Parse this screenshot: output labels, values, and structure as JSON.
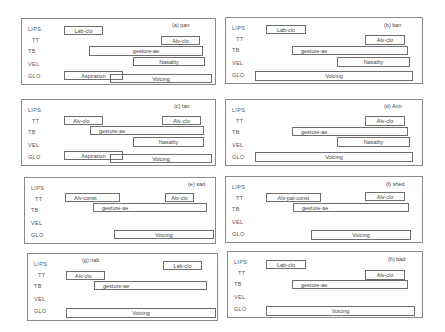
{
  "tiers": [
    {
      "key": "LIPS",
      "label": "LIPS",
      "y": 7,
      "indent": false
    },
    {
      "key": "TT",
      "label": "TT",
      "y": 18,
      "indent": true
    },
    {
      "key": "TB",
      "label": "TB",
      "y": 29,
      "indent": false
    },
    {
      "key": "VEL",
      "label": "VEL",
      "y": 42,
      "indent": false
    },
    {
      "key": "GLO",
      "label": "GLO",
      "y": 54,
      "indent": false
    }
  ],
  "panels": [
    {
      "id": "a",
      "title": "(a) pan",
      "x": 21,
      "y": 18,
      "w": 195,
      "h": 67,
      "title_x": 150,
      "title_y": 3,
      "gestures": [
        {
          "label": "Lab-clo",
          "tier": "LIPS",
          "x": 42,
          "y": 7,
          "w": 39,
          "h": 9,
          "align": "center"
        },
        {
          "label": "Alv-clo",
          "tier": "TT",
          "x": 139,
          "y": 17,
          "w": 39,
          "h": 9,
          "align": "center"
        },
        {
          "label": "gesture-ae",
          "tier": "TB",
          "x": 67,
          "y": 27,
          "w": 114,
          "h": 10,
          "align": "center"
        },
        {
          "label": "Nasality",
          "tier": "VEL",
          "x": 111,
          "y": 38,
          "w": 72,
          "h": 9,
          "align": "center"
        },
        {
          "label": "Voicing",
          "tier": "GLO",
          "x": 88,
          "y": 55,
          "w": 102,
          "h": 9,
          "align": "center"
        },
        {
          "label": "Aspiration",
          "tier": "GLO",
          "x": 42,
          "y": 52,
          "w": 59,
          "h": 9,
          "align": "center",
          "transparent": true
        }
      ]
    },
    {
      "id": "b",
      "title": "(b) ban",
      "x": 225,
      "y": 17,
      "w": 198,
      "h": 67,
      "title_x": 158,
      "title_y": 4,
      "gestures": [
        {
          "label": "Lab-clo",
          "tier": "LIPS",
          "x": 40,
          "y": 7,
          "w": 40,
          "h": 9,
          "align": "center"
        },
        {
          "label": "Alv-clo",
          "tier": "TT",
          "x": 139,
          "y": 17,
          "w": 40,
          "h": 10,
          "align": "center"
        },
        {
          "label": "gesture-ae",
          "tier": "TB",
          "x": 66,
          "y": 28,
          "w": 116,
          "h": 9,
          "align": "left"
        },
        {
          "label": "Nasality",
          "tier": "VEL",
          "x": 111,
          "y": 39,
          "w": 73,
          "h": 10,
          "align": "center"
        },
        {
          "label": "Voicing",
          "tier": "GLO",
          "x": 29,
          "y": 53,
          "w": 158,
          "h": 10,
          "align": "center"
        }
      ]
    },
    {
      "id": "c",
      "title": "(c) tan",
      "x": 21,
      "y": 99,
      "w": 195,
      "h": 67,
      "title_x": 152,
      "title_y": 3,
      "gestures": [
        {
          "label": "Alv-clo",
          "tier": "TT",
          "x": 42,
          "y": 16,
          "w": 39,
          "h": 9,
          "align": "left"
        },
        {
          "label": "Alv-clo",
          "tier": "TT",
          "x": 140,
          "y": 16,
          "w": 39,
          "h": 9,
          "align": "center"
        },
        {
          "label": "gesture-ae",
          "tier": "TB",
          "x": 68,
          "y": 26,
          "w": 114,
          "h": 9,
          "align": "left"
        },
        {
          "label": "Nasality",
          "tier": "VEL",
          "x": 111,
          "y": 37,
          "w": 71,
          "h": 10,
          "align": "center"
        },
        {
          "label": "Voicing",
          "tier": "GLO",
          "x": 88,
          "y": 54,
          "w": 102,
          "h": 9,
          "align": "center"
        },
        {
          "label": "Aspiration",
          "tier": "GLO",
          "x": 42,
          "y": 51,
          "w": 59,
          "h": 9,
          "align": "center",
          "transparent": true
        }
      ]
    },
    {
      "id": "d",
      "title": "(d) Ann",
      "x": 225,
      "y": 99,
      "w": 198,
      "h": 67,
      "title_x": 158,
      "title_y": 3,
      "gestures": [
        {
          "label": "Alv-clo",
          "tier": "TT",
          "x": 139,
          "y": 16,
          "w": 40,
          "h": 10,
          "align": "center"
        },
        {
          "label": "gesture-ae",
          "tier": "TB",
          "x": 66,
          "y": 27,
          "w": 116,
          "h": 9,
          "align": "left"
        },
        {
          "label": "Nasality",
          "tier": "VEL",
          "x": 111,
          "y": 37,
          "w": 73,
          "h": 10,
          "align": "center"
        },
        {
          "label": "Voicing",
          "tier": "GLO",
          "x": 29,
          "y": 52,
          "w": 158,
          "h": 10,
          "align": "center"
        }
      ]
    },
    {
      "id": "e",
      "title": "(e) sad",
      "x": 24,
      "y": 177,
      "w": 192,
      "h": 67,
      "title_x": 163,
      "title_y": 3,
      "gestures": [
        {
          "label": "Alv-const",
          "tier": "TT",
          "x": 40,
          "y": 15,
          "w": 55,
          "h": 9,
          "align": "left"
        },
        {
          "label": "Alv-clo",
          "tier": "TT",
          "x": 140,
          "y": 15,
          "w": 29,
          "h": 9,
          "align": "center"
        },
        {
          "label": "gesture-ae",
          "tier": "TB",
          "x": 68,
          "y": 25,
          "w": 114,
          "h": 9,
          "align": "left"
        },
        {
          "label": "Voicing",
          "tier": "GLO",
          "x": 89,
          "y": 52,
          "w": 100,
          "h": 9,
          "align": "center"
        }
      ]
    },
    {
      "id": "f",
      "title": "(f) shed",
      "x": 225,
      "y": 176,
      "w": 198,
      "h": 67,
      "title_x": 160,
      "title_y": 4,
      "gestures": [
        {
          "label": "Alv-pal-const",
          "tier": "TT",
          "x": 40,
          "y": 16,
          "w": 55,
          "h": 9,
          "align": "center"
        },
        {
          "label": "Alv-clo",
          "tier": "TT",
          "x": 139,
          "y": 15,
          "w": 40,
          "h": 9,
          "align": "center"
        },
        {
          "label": "gesture-ae",
          "tier": "TB",
          "x": 67,
          "y": 26,
          "w": 116,
          "h": 9,
          "align": "left"
        },
        {
          "label": "Voicing",
          "tier": "GLO",
          "x": 85,
          "y": 53,
          "w": 100,
          "h": 10,
          "align": "center"
        }
      ]
    },
    {
      "id": "g",
      "title": "(g) nab",
      "x": 27,
      "y": 253,
      "w": 191,
      "h": 68,
      "title_x": 54,
      "title_y": 3,
      "gestures": [
        {
          "label": "Lab-clo",
          "tier": "LIPS",
          "x": 135,
          "y": 7,
          "w": 39,
          "h": 9,
          "align": "center"
        },
        {
          "label": "Alv-clo",
          "tier": "TT",
          "x": 38,
          "y": 17,
          "w": 39,
          "h": 9,
          "align": "left"
        },
        {
          "label": "gesture-ae",
          "tier": "TB",
          "x": 66,
          "y": 27,
          "w": 113,
          "h": 9,
          "align": "left"
        },
        {
          "label": "Voicing",
          "tier": "GLO",
          "x": 38,
          "y": 54,
          "w": 150,
          "h": 10,
          "align": "center"
        }
      ]
    },
    {
      "id": "h",
      "title": "(h) bad",
      "x": 227,
      "y": 251,
      "w": 196,
      "h": 67,
      "title_x": 160,
      "title_y": 4,
      "gestures": [
        {
          "label": "Lab-clo",
          "tier": "LIPS",
          "x": 38,
          "y": 8,
          "w": 40,
          "h": 9,
          "align": "center"
        },
        {
          "label": "Alv-clo",
          "tier": "TT",
          "x": 137,
          "y": 18,
          "w": 40,
          "h": 10,
          "align": "center"
        },
        {
          "label": "gesture-ae",
          "tier": "TB",
          "x": 64,
          "y": 28,
          "w": 116,
          "h": 9,
          "align": "left"
        },
        {
          "label": "Voicing",
          "tier": "GLO",
          "x": 38,
          "y": 54,
          "w": 149,
          "h": 10,
          "align": "center"
        }
      ]
    }
  ],
  "colors": {
    "border": "#8a8a8a",
    "box_border": "#6e6e6e",
    "text": "#444444",
    "background": "#ffffff"
  }
}
